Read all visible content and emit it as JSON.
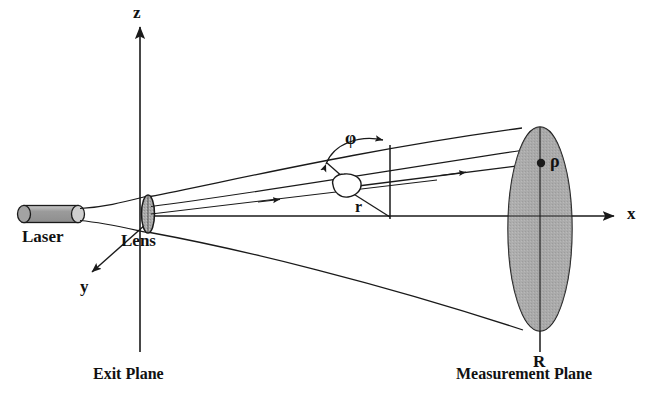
{
  "figure": {
    "type": "optical-scattering-schematic",
    "background_color": "#ffffff",
    "line_color": "#1a1a1a",
    "fill_gray": "#a8a8a8",
    "fill_gray_light": "#bdbdbd"
  },
  "axes": {
    "z": {
      "label": "z",
      "x": 140,
      "y_top": 20,
      "y_bottom": 350,
      "arrow": "up"
    },
    "x": {
      "label": "x",
      "y": 216,
      "x_left": 150,
      "x_right": 617,
      "arrow": "right"
    },
    "y": {
      "label": "y",
      "from_x": 152,
      "from_y": 218,
      "to_x": 88,
      "to_y": 276,
      "arrow": "down-left"
    }
  },
  "components": {
    "laser": {
      "label": "Laser",
      "x": 18,
      "y": 206,
      "width": 62,
      "height": 17
    },
    "lens": {
      "label": "Lens",
      "cx": 148,
      "cy": 214,
      "rx": 7,
      "ry": 18
    },
    "particle": {
      "label": "",
      "cx": 345,
      "cy": 190,
      "r": 14
    },
    "scatter_point": {
      "label": "ρ",
      "cx": 542,
      "cy": 163
    },
    "measurement_disc": {
      "label": "R",
      "cx": 540,
      "cy": 229,
      "rx": 32,
      "ry": 102
    }
  },
  "labels": {
    "laser": "Laser",
    "lens": "Lens",
    "exit_plane": "Exit Plane",
    "measurement_plane": "Measurement Plane",
    "axis_z": "z",
    "axis_x": "x",
    "axis_y": "y",
    "angle_phi": "φ",
    "radius_r": "r",
    "rho": "ρ",
    "radius_R": "R"
  },
  "annotations": {
    "phi": {
      "symbol": "φ",
      "meaning": "scattering angle",
      "x": 351,
      "y": 139
    },
    "r": {
      "symbol": "r",
      "meaning": "radial position in exit plane",
      "x": 358,
      "y": 209
    },
    "rho": {
      "symbol": "ρ",
      "meaning": "radial position in measurement plane",
      "x": 551,
      "y": 161
    },
    "R": {
      "symbol": "R",
      "meaning": "measurement plane radius",
      "x": 536,
      "y": 360
    }
  }
}
